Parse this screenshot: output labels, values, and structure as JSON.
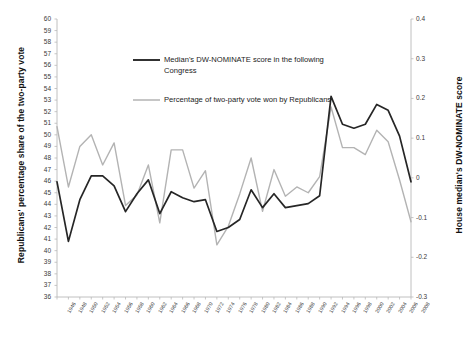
{
  "chart_data": {
    "type": "line",
    "title": "",
    "xlabel": "",
    "ylabel": "Republicans' percentage share of the two-party vote",
    "y2label": "House median's DW-NOMINATE score",
    "grid": false,
    "legend_position": "inside-top-center",
    "categories": [
      "1946",
      "1948",
      "1950",
      "1952",
      "1954",
      "1956",
      "1958",
      "1960",
      "1962",
      "1964",
      "1966",
      "1968",
      "1970",
      "1972",
      "1974",
      "1976",
      "1978",
      "1980",
      "1982",
      "1984",
      "1986",
      "1988",
      "1990",
      "1992",
      "1994",
      "1996",
      "1998",
      "2000",
      "2002",
      "2004",
      "2006",
      "2008"
    ],
    "x_tick_labels": [
      "1946",
      "1948",
      "1950",
      "1952",
      "1954",
      "1956",
      "1958",
      "1960",
      "1962",
      "1964",
      "1966",
      "1968",
      "1970",
      "1972",
      "1974",
      "1976",
      "1978",
      "1980",
      "1982",
      "1984",
      "1986",
      "1988",
      "1990",
      "1992",
      "1994",
      "1996",
      "1998",
      "2000",
      "2002",
      "2004",
      "2006",
      "2008"
    ],
    "ylim": [
      36,
      60
    ],
    "y_ticks": [
      36,
      37,
      38,
      39,
      40,
      41,
      42,
      43,
      44,
      45,
      46,
      47,
      48,
      49,
      50,
      51,
      52,
      53,
      54,
      55,
      56,
      57,
      58,
      59,
      60
    ],
    "y2lim": [
      -0.3,
      0.4
    ],
    "y2_ticks": [
      -0.3,
      -0.2,
      -0.1,
      0,
      0.1,
      0.2,
      0.3,
      0.4
    ],
    "y2_tick_labels": [
      "-0.3",
      "-0.2",
      "-0.1",
      "0",
      "0.1",
      "0.2",
      "0.3",
      "0.4"
    ],
    "series": [
      {
        "name": "Median's DW-NOMINATE score in the following Congress",
        "axis": "right",
        "color": "#262626",
        "width": 1.7,
        "values": [
          -0.01,
          -0.16,
          -0.055,
          0.005,
          0.005,
          -0.02,
          -0.085,
          -0.04,
          -0.005,
          -0.09,
          -0.035,
          -0.05,
          -0.06,
          -0.055,
          -0.135,
          -0.125,
          -0.105,
          -0.03,
          -0.075,
          -0.04,
          -0.075,
          -0.07,
          -0.065,
          -0.045,
          0.205,
          0.135,
          0.125,
          0.135,
          0.185,
          0.17,
          0.105,
          -0.01
        ]
      },
      {
        "name": "Percentage of two-party vote won by Republicans",
        "axis": "left",
        "color": "#b3b3b3",
        "width": 1.4,
        "values": [
          50.7,
          45.5,
          49.0,
          50.0,
          47.4,
          49.3,
          43.9,
          44.8,
          47.4,
          42.4,
          48.7,
          48.7,
          45.4,
          46.9,
          40.5,
          42.1,
          44.9,
          48.0,
          43.4,
          47.0,
          44.7,
          45.5,
          45.0,
          46.4,
          52.4,
          48.9,
          48.9,
          48.3,
          50.4,
          49.4,
          46.1,
          42.5
        ]
      }
    ],
    "legend": [
      {
        "label_line1": "Median's DW-NOMINATE score in the following",
        "label_line2": "Congress",
        "color": "#262626"
      },
      {
        "label_line1": "Percentage of two-party vote won by Republicans",
        "label_line2": "",
        "color": "#b3b3b3"
      }
    ]
  },
  "caption": ""
}
